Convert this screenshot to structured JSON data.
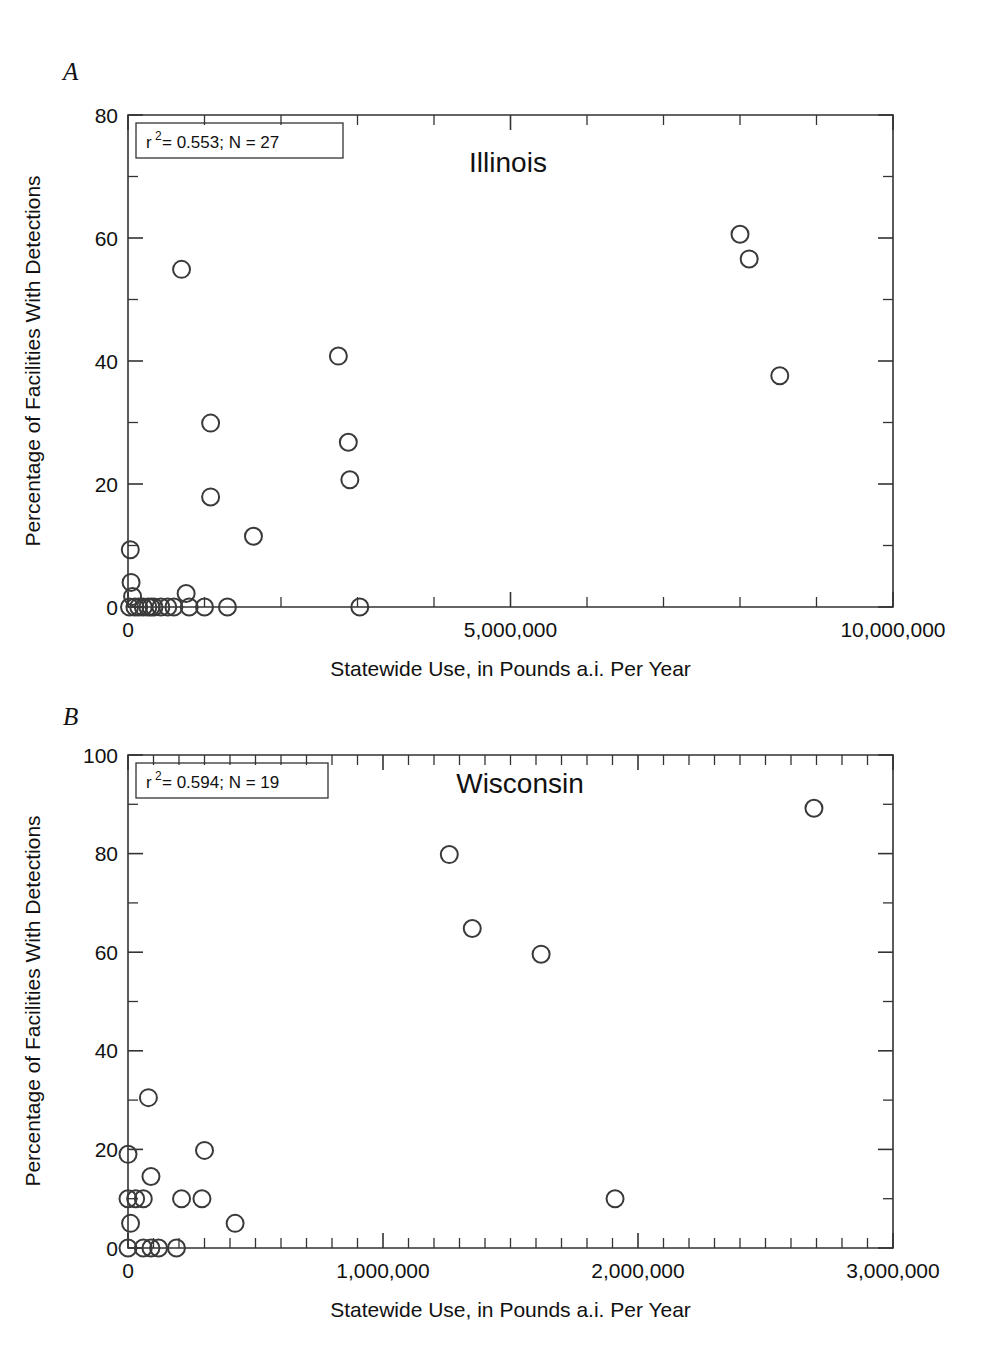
{
  "figure": {
    "panels": [
      {
        "id": "a",
        "letter": "A",
        "title": "Illinois",
        "stat_base": "r",
        "stat_exponent": "2",
        "stat_rest": " = 0.553; N = 27"
      },
      {
        "id": "b",
        "letter": "B",
        "title": "Wisconsin",
        "stat_base": "r",
        "stat_exponent": "2",
        "stat_rest": " = 0.594; N = 19"
      }
    ]
  },
  "chart_data": [
    {
      "type": "scatter",
      "panel": "A",
      "title": "Illinois",
      "xlabel": "Statewide Use, in Pounds a.i. Per Year",
      "ylabel": "Percentage of Facilities With Detections",
      "annotation": "r2 = 0.553; N = 27",
      "r_squared": 0.553,
      "n": 27,
      "xlim": [
        0,
        10000000
      ],
      "ylim": [
        0,
        80
      ],
      "xticks": [
        0,
        5000000,
        10000000
      ],
      "xtick_labels": [
        "0",
        "5,000,000",
        "10,000,000"
      ],
      "xminor_interval": 1000000,
      "yticks": [
        0,
        20,
        40,
        60,
        80
      ],
      "ytick_labels": [
        "0",
        "20",
        "40",
        "60",
        "80"
      ],
      "yminor_interval": 10,
      "grid": false,
      "legend": "none",
      "marker": "open-circle",
      "points": [
        {
          "x": 30000,
          "y": 9.3
        },
        {
          "x": 40000,
          "y": 4.0
        },
        {
          "x": 60000,
          "y": 1.7
        },
        {
          "x": 20000,
          "y": 0.0
        },
        {
          "x": 90000,
          "y": 0.0
        },
        {
          "x": 140000,
          "y": 0.0
        },
        {
          "x": 200000,
          "y": 0.0
        },
        {
          "x": 260000,
          "y": 0.0
        },
        {
          "x": 300000,
          "y": 0.0
        },
        {
          "x": 340000,
          "y": 0.0
        },
        {
          "x": 430000,
          "y": 0.0
        },
        {
          "x": 520000,
          "y": 0.0
        },
        {
          "x": 600000,
          "y": 0.0
        },
        {
          "x": 760000,
          "y": 2.2
        },
        {
          "x": 800000,
          "y": 0.0
        },
        {
          "x": 1000000,
          "y": 0.0
        },
        {
          "x": 700000,
          "y": 54.9
        },
        {
          "x": 1080000,
          "y": 29.9
        },
        {
          "x": 1080000,
          "y": 17.9
        },
        {
          "x": 1300000,
          "y": 0.0
        },
        {
          "x": 1640000,
          "y": 11.5
        },
        {
          "x": 2750000,
          "y": 40.8
        },
        {
          "x": 2880000,
          "y": 26.8
        },
        {
          "x": 2900000,
          "y": 20.7
        },
        {
          "x": 3030000,
          "y": 0.0
        },
        {
          "x": 8000000,
          "y": 60.6
        },
        {
          "x": 8120000,
          "y": 56.6
        },
        {
          "x": 8520000,
          "y": 37.6
        }
      ]
    },
    {
      "type": "scatter",
      "panel": "B",
      "title": "Wisconsin",
      "xlabel": "Statewide Use, in Pounds a.i. Per Year",
      "ylabel": "Percentage of Facilities With Detections",
      "annotation": "r2 = 0.594; N = 19",
      "r_squared": 0.594,
      "n": 19,
      "xlim": [
        0,
        3000000
      ],
      "ylim": [
        0,
        100
      ],
      "xticks": [
        0,
        1000000,
        2000000,
        3000000
      ],
      "xtick_labels": [
        "0",
        "1,000,000",
        "2,000,000",
        "3,000,000"
      ],
      "xminor_interval": 100000,
      "yticks": [
        0,
        20,
        40,
        60,
        80,
        100
      ],
      "ytick_labels": [
        "0",
        "20",
        "40",
        "60",
        "80",
        "100"
      ],
      "yminor_interval": 10,
      "grid": false,
      "legend": "none",
      "marker": "open-circle",
      "points": [
        {
          "x": 0,
          "y": 19.0
        },
        {
          "x": 0,
          "y": 10.0
        },
        {
          "x": 30000,
          "y": 10.0
        },
        {
          "x": 60000,
          "y": 10.0
        },
        {
          "x": 10000,
          "y": 5.0
        },
        {
          "x": 0,
          "y": 0.0
        },
        {
          "x": 60000,
          "y": 0.0
        },
        {
          "x": 90000,
          "y": 0.0
        },
        {
          "x": 120000,
          "y": 0.0
        },
        {
          "x": 190000,
          "y": 0.0
        },
        {
          "x": 80000,
          "y": 30.5
        },
        {
          "x": 90000,
          "y": 14.5
        },
        {
          "x": 210000,
          "y": 10.0
        },
        {
          "x": 290000,
          "y": 10.0
        },
        {
          "x": 300000,
          "y": 19.8
        },
        {
          "x": 420000,
          "y": 5.0
        },
        {
          "x": 1260000,
          "y": 79.8
        },
        {
          "x": 1350000,
          "y": 64.8
        },
        {
          "x": 1620000,
          "y": 59.6
        },
        {
          "x": 1910000,
          "y": 10.0
        },
        {
          "x": 2690000,
          "y": 89.2
        }
      ]
    }
  ]
}
